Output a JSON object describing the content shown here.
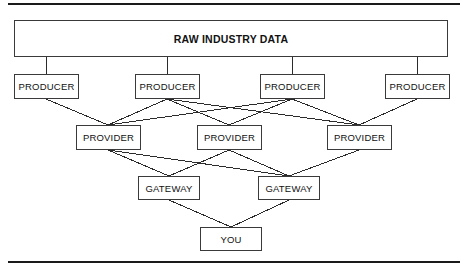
{
  "diagram": {
    "title_box": {
      "label": "RAW INDUSTRY DATA"
    },
    "producers": [
      {
        "label": "PRODUCER"
      },
      {
        "label": "PRODUCER"
      },
      {
        "label": "PRODUCER"
      },
      {
        "label": "PRODUCER"
      }
    ],
    "providers": [
      {
        "label": "PROVIDER"
      },
      {
        "label": "PROVIDER"
      },
      {
        "label": "PROVIDER"
      }
    ],
    "gateways": [
      {
        "label": "GATEWAY"
      },
      {
        "label": "GATEWAY"
      }
    ],
    "destination": {
      "label": "YOU"
    },
    "colors": {
      "rule": "#1a1a1a",
      "box_border": "#3a3a3a",
      "edge": "#2b2b2b",
      "text": "#111111",
      "background": "#ffffff"
    }
  }
}
